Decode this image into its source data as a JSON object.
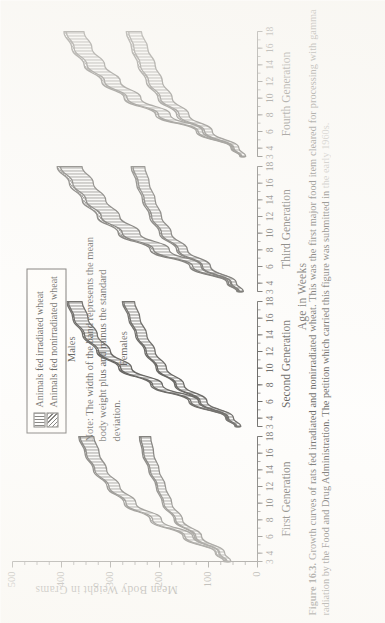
{
  "figure": {
    "number": "Figure 16.3.",
    "caption_line1": "Growth curves of rats fed irradiated and nonirradiated wheat. This was the first major food item cleared for",
    "caption_line2": "processing with gamma radiation by the Food and Drug Administration. The petition which carried this figure was submitted in",
    "caption_line3": "the early 1960s."
  },
  "note": {
    "text": "Note: The width of the band represents the mean body weight plus and minus the standard deviation."
  },
  "legend": {
    "items": [
      {
        "label": "Animals fed irradiated wheat",
        "pattern": "vertical-hatch",
        "color": "#2b2824"
      },
      {
        "label": "Animals fed nonirradiated wheat",
        "pattern": "diagonal-crosshatch",
        "color": "#2b2824"
      }
    ]
  },
  "chart_data": {
    "type": "line",
    "title": "",
    "xlabel": "Age in Weeks",
    "ylabel": "Mean Body Weight in Grams",
    "ylim": [
      0,
      500
    ],
    "yticks": [
      0,
      100,
      200,
      300,
      400,
      500
    ],
    "minor_y_ticks": true,
    "grid": false,
    "legend_position": "top-left",
    "panels": [
      {
        "name": "First Generation",
        "xticks": [
          "3",
          "4",
          "6",
          "8",
          "10",
          "12",
          "14",
          "16",
          "18"
        ],
        "xlim": [
          3,
          18
        ],
        "series": [
          {
            "name": "Males - irradiated wheat",
            "sex": "Males",
            "diet": "irradiated",
            "x": [
              3,
              4,
              6,
              8,
              10,
              12,
              14,
              16,
              18
            ],
            "mean": [
              62,
              78,
              140,
              205,
              258,
              292,
              320,
              336,
              348
            ],
            "sd": [
              5,
              6,
              8,
              9,
              10,
              11,
              12,
              13,
              14
            ]
          },
          {
            "name": "Males - nonirradiated wheat",
            "sex": "Males",
            "diet": "nonirradiated",
            "x": [
              3,
              4,
              6,
              8,
              10,
              12,
              14,
              16,
              18
            ],
            "mean": [
              64,
              80,
              144,
              210,
              262,
              296,
              323,
              339,
              351
            ],
            "sd": [
              5,
              6,
              8,
              9,
              10,
              11,
              12,
              13,
              14
            ]
          },
          {
            "name": "Females - irradiated wheat",
            "sex": "Females",
            "diet": "irradiated",
            "x": [
              3,
              4,
              6,
              8,
              10,
              12,
              14,
              16,
              18
            ],
            "mean": [
              58,
              72,
              120,
              160,
              183,
              196,
              210,
              222,
              228
            ],
            "sd": [
              4,
              5,
              6,
              7,
              8,
              8,
              9,
              10,
              10
            ]
          },
          {
            "name": "Females - nonirradiated wheat",
            "sex": "Females",
            "diet": "nonirradiated",
            "x": [
              3,
              4,
              6,
              8,
              10,
              12,
              14,
              16,
              18
            ],
            "mean": [
              60,
              74,
              123,
              163,
              186,
              199,
              213,
              225,
              231
            ],
            "sd": [
              4,
              5,
              6,
              7,
              8,
              8,
              9,
              10,
              10
            ]
          }
        ]
      },
      {
        "name": "Second Generation",
        "xticks": [
          "3",
          "4",
          "6",
          "8",
          "10",
          "12",
          "14",
          "16",
          "18"
        ],
        "xlim": [
          3,
          18
        ],
        "series": [
          {
            "name": "Males - irradiated wheat",
            "sex": "Males",
            "diet": "irradiated",
            "x": [
              3,
              4,
              6,
              8,
              10,
              12,
              14,
              16,
              18
            ],
            "mean": [
              40,
              58,
              128,
              204,
              268,
              312,
              340,
              360,
              372
            ],
            "sd": [
              4,
              5,
              8,
              10,
              11,
              12,
              13,
              14,
              14
            ]
          },
          {
            "name": "Males - nonirradiated wheat",
            "sex": "Males",
            "diet": "nonirradiated",
            "x": [
              3,
              4,
              6,
              8,
              10,
              12,
              14,
              16,
              18
            ],
            "mean": [
              42,
              60,
              132,
              208,
              272,
              316,
              344,
              363,
              375
            ],
            "sd": [
              4,
              5,
              8,
              10,
              11,
              12,
              13,
              14,
              14
            ]
          },
          {
            "name": "Females - irradiated wheat",
            "sex": "Females",
            "diet": "irradiated",
            "x": [
              3,
              4,
              6,
              8,
              10,
              12,
              14,
              16,
              18
            ],
            "mean": [
              38,
              54,
              110,
              158,
              195,
              218,
              236,
              250,
              262
            ],
            "sd": [
              4,
              5,
              7,
              8,
              9,
              9,
              10,
              10,
              11
            ]
          },
          {
            "name": "Females - nonirradiated wheat",
            "sex": "Females",
            "diet": "nonirradiated",
            "x": [
              3,
              4,
              6,
              8,
              10,
              12,
              14,
              16,
              18
            ],
            "mean": [
              40,
              56,
              113,
              161,
              198,
              221,
              239,
              253,
              265
            ],
            "sd": [
              4,
              5,
              7,
              8,
              9,
              9,
              10,
              10,
              11
            ]
          }
        ]
      },
      {
        "name": "Third Generation",
        "xticks": [
          "3",
          "4",
          "6",
          "8",
          "10",
          "12",
          "14",
          "16",
          "18"
        ],
        "xlim": [
          3,
          18
        ],
        "series": [
          {
            "name": "Males - irradiated wheat",
            "sex": "Males",
            "diet": "irradiated",
            "x": [
              3,
              4,
              6,
              8,
              10,
              12,
              14,
              16,
              18
            ],
            "mean": [
              35,
              52,
              120,
              196,
              258,
              300,
              330,
              356,
              380
            ],
            "sd": [
              5,
              7,
              12,
              16,
              18,
              19,
              20,
              21,
              22
            ]
          },
          {
            "name": "Males - nonirradiated wheat",
            "sex": "Males",
            "diet": "nonirradiated",
            "x": [
              3,
              4,
              6,
              8,
              10,
              12,
              14,
              16,
              18
            ],
            "mean": [
              37,
              55,
              126,
              203,
              266,
              308,
              338,
              363,
              387
            ],
            "sd": [
              5,
              7,
              12,
              16,
              18,
              19,
              20,
              21,
              22
            ]
          },
          {
            "name": "Females - irradiated wheat",
            "sex": "Females",
            "diet": "irradiated",
            "x": [
              3,
              4,
              6,
              8,
              10,
              12,
              14,
              16,
              18
            ],
            "mean": [
              33,
              48,
              104,
              152,
              186,
              206,
              220,
              232,
              242
            ],
            "sd": [
              4,
              5,
              8,
              9,
              10,
              10,
              11,
              11,
              12
            ]
          },
          {
            "name": "Females - nonirradiated wheat",
            "sex": "Females",
            "diet": "nonirradiated",
            "x": [
              3,
              4,
              6,
              8,
              10,
              12,
              14,
              16,
              18
            ],
            "mean": [
              35,
              50,
              107,
              156,
              190,
              210,
              224,
              236,
              246
            ],
            "sd": [
              4,
              5,
              8,
              9,
              10,
              10,
              11,
              11,
              12
            ]
          }
        ]
      },
      {
        "name": "Fourth Generation",
        "xticks": [
          "3",
          "4",
          "6",
          "8",
          "10",
          "12",
          "14",
          "16",
          "18"
        ],
        "xlim": [
          3,
          18
        ],
        "series": [
          {
            "name": "Males - irradiated wheat",
            "sex": "Males",
            "diet": "irradiated",
            "x": [
              3,
              4,
              6,
              8,
              10,
              12,
              14,
              16,
              18
            ],
            "mean": [
              30,
              46,
              112,
              190,
              252,
              296,
              330,
              356,
              372
            ],
            "sd": [
              4,
              6,
              9,
              12,
              14,
              16,
              18,
              18,
              18
            ]
          },
          {
            "name": "Males - nonirradiated wheat",
            "sex": "Males",
            "diet": "nonirradiated",
            "x": [
              3,
              4,
              6,
              8,
              10,
              12,
              14,
              16,
              18
            ],
            "mean": [
              32,
              48,
              116,
              196,
              258,
              302,
              336,
              361,
              377
            ],
            "sd": [
              4,
              6,
              9,
              12,
              14,
              16,
              18,
              18,
              18
            ]
          },
          {
            "name": "Females - irradiated wheat",
            "sex": "Females",
            "diet": "irradiated",
            "x": [
              3,
              4,
              6,
              8,
              10,
              12,
              14,
              16,
              18
            ],
            "mean": [
              28,
              43,
              100,
              150,
              186,
              208,
              224,
              238,
              250
            ],
            "sd": [
              4,
              5,
              8,
              10,
              12,
              14,
              15,
              14,
              13
            ]
          },
          {
            "name": "Females - nonirradiated wheat",
            "sex": "Females",
            "diet": "nonirradiated",
            "x": [
              3,
              4,
              6,
              8,
              10,
              12,
              14,
              16,
              18
            ],
            "mean": [
              30,
              45,
              104,
              155,
              191,
              213,
              229,
              243,
              255
            ],
            "sd": [
              4,
              5,
              8,
              10,
              12,
              14,
              15,
              14,
              13
            ]
          }
        ]
      }
    ],
    "annotations": [
      {
        "text": "Males",
        "panel": "Second Generation"
      },
      {
        "text": "Females",
        "panel": "Second Generation"
      }
    ]
  }
}
